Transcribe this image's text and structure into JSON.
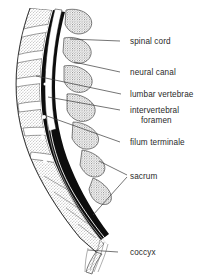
{
  "figure": {
    "background_color": "#ffffff",
    "ink_color": "#1a1a1a",
    "label_color": "#2a2a2a",
    "canal_fill": "#0d0d0d",
    "bone_stipple_color": "#6e6e6e",
    "disc_fill": "#ffffff"
  },
  "labels": [
    {
      "id": "spinal-cord",
      "text": "spinal cord",
      "x": 130,
      "y": 44,
      "dash_x1": 120,
      "dash_x2": 127,
      "leader": "M120,41 L70,39"
    },
    {
      "id": "neural-canal",
      "text": "neural canal",
      "x": 130,
      "y": 75,
      "dash_x1": 120,
      "dash_x2": 127,
      "leader": "M120,72 L74,62"
    },
    {
      "id": "lumbar-vertebrae",
      "text": "lumbar vertebrae",
      "x": 130,
      "y": 97,
      "dash_x1": 121,
      "dash_x2": 127,
      "leader": "M121,94 L36,76"
    },
    {
      "id": "intervertebral-foramen-line1",
      "text": "intervertebral",
      "x": 130,
      "y": 113,
      "dash_x1": 120,
      "dash_x2": 127,
      "leader": "M120,110 L48,97"
    },
    {
      "id": "intervertebral-foramen-line2",
      "text": "foramen",
      "x": 141,
      "y": 123,
      "dash_x1": 0,
      "dash_x2": 0,
      "leader": ""
    },
    {
      "id": "filum-terminale",
      "text": "filum terminale",
      "x": 130,
      "y": 145,
      "dash_x1": 120,
      "dash_x2": 127,
      "leader": "M120,142 L47,116"
    },
    {
      "id": "sacrum",
      "text": "sacrum",
      "x": 130,
      "y": 179,
      "dash_x1": 0,
      "dash_x2": 0,
      "leader": "M127,175 L99,161 M127,177 L93,215"
    },
    {
      "id": "coccyx",
      "text": "coccyx",
      "x": 130,
      "y": 255,
      "dash_x1": 118,
      "dash_x2": 127,
      "leader": "M118,252 L88,250"
    }
  ],
  "anatomy": {
    "vertebra_count": 5,
    "foramen_dot_count": 6,
    "parts": [
      "spinal cord",
      "neural canal",
      "lumbar vertebrae",
      "intervertebral foramen",
      "filum terminale",
      "sacrum",
      "coccyx"
    ]
  }
}
